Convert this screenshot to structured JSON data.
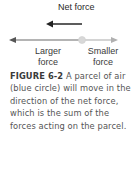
{
  "diagram": {
    "net_force_label": "Net force",
    "larger_force_label_line1": "Larger",
    "larger_force_label_line2": "force",
    "smaller_force_label_line1": "Smaller",
    "smaller_force_label_line2": "force",
    "colors": {
      "net_arrow": "#333333",
      "larger_arrow": "#6b6b6b",
      "smaller_arrow": "#b8b8b8",
      "parcel": "#d8d8d8"
    }
  },
  "caption": {
    "figure_number": "FIGURE 6-2",
    "text": " A parcel of air (blue circle) will move in the direction of the net force, which is the sum of the forces acting on the parcel."
  }
}
